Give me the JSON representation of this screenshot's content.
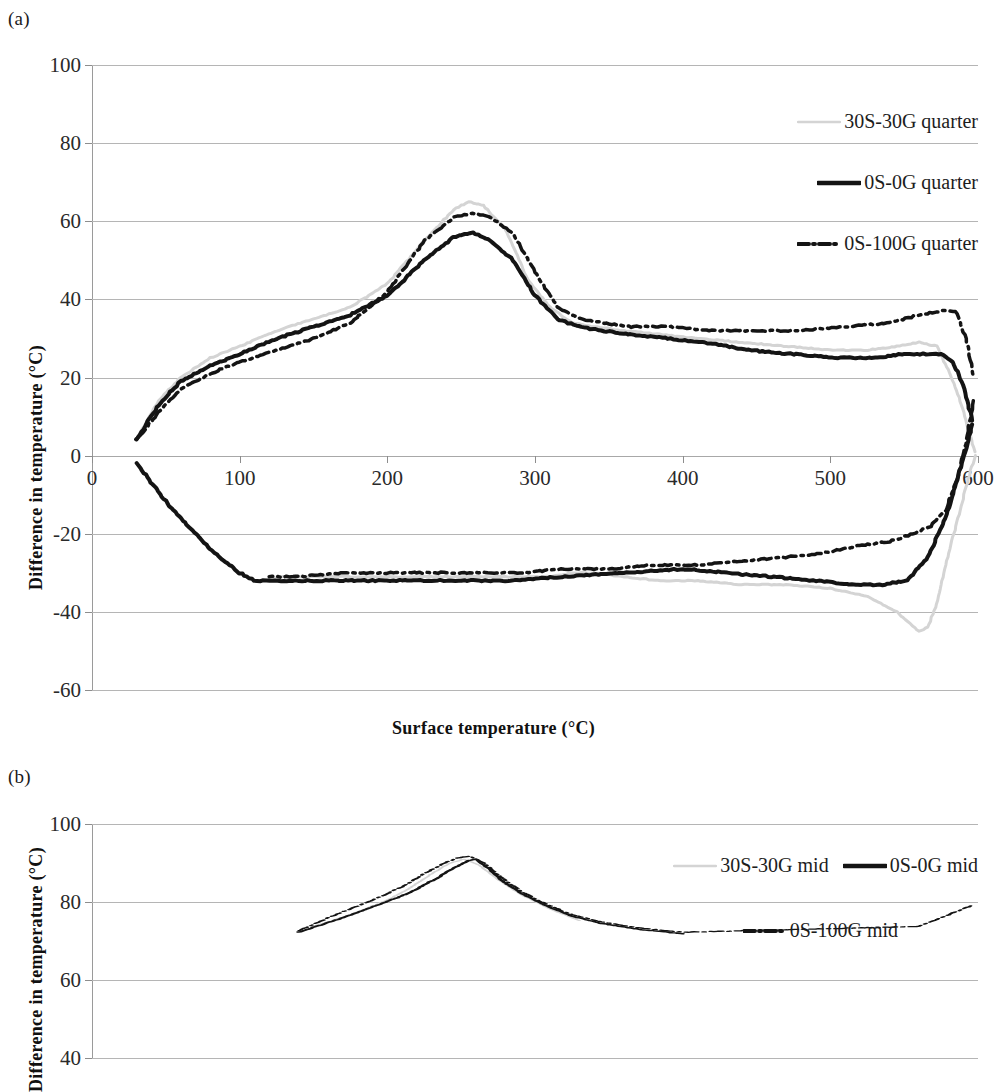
{
  "panels": [
    {
      "id": "a",
      "label": "(a)"
    },
    {
      "id": "b",
      "label": "(b)"
    }
  ],
  "chart_data": [
    {
      "panel": "a",
      "type": "line",
      "title": "",
      "xlabel": "Surface temperature  (°C)",
      "ylabel": "Difference in temperature (°C)",
      "xlim": [
        0,
        600
      ],
      "ylim": [
        -60,
        100
      ],
      "xticks": [
        0,
        100,
        200,
        300,
        400,
        500,
        600
      ],
      "yticks": [
        -60,
        -40,
        -20,
        0,
        20,
        40,
        60,
        80,
        100
      ],
      "grid": true,
      "legend_position": "top-right",
      "series": [
        {
          "name": "30S-30G quarter",
          "style": "solid",
          "color": "#d4d4d4",
          "width": 3,
          "branch_up": {
            "x": [
              30,
              45,
              60,
              80,
              100,
              125,
              150,
              175,
              200,
              225,
              245,
              255,
              265,
              280,
              295,
              310,
              325,
              340,
              360,
              385,
              410,
              440,
              470,
              500,
              525,
              545,
              560,
              572,
              580,
              588,
              594,
              598
            ],
            "y": [
              4,
              14,
              20,
              25,
              28,
              32,
              35,
              38,
              44,
              55,
              63,
              65,
              64,
              58,
              45,
              38,
              34,
              33,
              32,
              31,
              30,
              29,
              28,
              27,
              27,
              28,
              29,
              28,
              22,
              14,
              6,
              1
            ]
          },
          "branch_down": {
            "x": [
              598,
              592,
              585,
              578,
              572,
              566,
              560,
              545,
              525,
              500,
              470,
              440,
              410,
              385,
              360,
              340,
              325,
              310,
              295,
              280,
              265,
              250,
              225,
              200,
              175,
              150,
              130,
              115
            ],
            "y": [
              0,
              -8,
              -18,
              -28,
              -38,
              -44,
              -45,
              -40,
              -36,
              -34,
              -33,
              -33,
              -32,
              -32,
              -31,
              -30,
              -30,
              -31,
              -31,
              -31,
              -31,
              -31,
              -31,
              -31,
              -31,
              -31,
              -31,
              -32
            ]
          }
        },
        {
          "name": "0S-0G quarter",
          "style": "solid",
          "color": "#141414",
          "width": 4,
          "branch_up": {
            "x": [
              30,
              45,
              60,
              80,
              100,
              125,
              150,
              175,
              200,
              225,
              245,
              258,
              270,
              285,
              300,
              315,
              330,
              345,
              365,
              390,
              415,
              445,
              475,
              505,
              530,
              550,
              565,
              575,
              583,
              590,
              596
            ],
            "y": [
              4,
              13,
              19,
              23,
              26,
              30,
              33,
              36,
              41,
              50,
              56,
              57,
              55,
              50,
              41,
              35,
              33,
              32,
              31,
              30,
              29,
              27,
              26,
              25,
              25,
              26,
              26,
              26,
              24,
              18,
              9
            ]
          },
          "branch_down": {
            "x": [
              30,
              55,
              80,
              100,
              110,
              130,
              160,
              200,
              240,
              280,
              320,
              360,
              400,
              430,
              460,
              490,
              515,
              535,
              552,
              566,
              578,
              586,
              592,
              596
            ],
            "y": [
              -2,
              -14,
              -24,
              -30,
              -32,
              -32,
              -32,
              -32,
              -32,
              -32,
              -31,
              -30,
              -29,
              -30,
              -31,
              -32,
              -33,
              -33,
              -32,
              -26,
              -16,
              -6,
              2,
              8
            ]
          }
        },
        {
          "name": "0S-100G quarter",
          "style": "dashdot",
          "color": "#141414",
          "width": 3.5,
          "branch_up": {
            "x": [
              30,
              45,
              60,
              80,
              100,
              125,
              150,
              175,
              200,
              225,
              245,
              258,
              270,
              285,
              300,
              315,
              330,
              345,
              365,
              390,
              420,
              450,
              480,
              510,
              540,
              560,
              575,
              585,
              592,
              597
            ],
            "y": [
              4,
              11,
              17,
              21,
              24,
              27,
              30,
              34,
              42,
              55,
              61,
              62,
              61,
              57,
              47,
              38,
              35,
              34,
              33,
              33,
              32,
              32,
              32,
              33,
              34,
              36,
              37,
              37,
              30,
              20
            ]
          },
          "branch_down": {
            "x": [
              597,
              592,
              586,
              578,
              568,
              556,
              540,
              520,
              495,
              470,
              440,
              410,
              380,
              350,
              320,
              290,
              260,
              230,
              200,
              170,
              140,
              120
            ],
            "y": [
              14,
              4,
              -6,
              -14,
              -18,
              -20,
              -22,
              -23,
              -25,
              -26,
              -27,
              -28,
              -28,
              -29,
              -29,
              -30,
              -30,
              -30,
              -30,
              -30,
              -31,
              -31
            ]
          }
        }
      ]
    },
    {
      "panel": "b",
      "type": "line",
      "title": "",
      "xlabel": "Surface temperature  (°C)",
      "ylabel": "Difference in temperature (°C)",
      "xlim": [
        0,
        600
      ],
      "ylim": [
        -60,
        100
      ],
      "yticks": [
        100,
        80,
        60,
        40
      ],
      "grid": true,
      "legend_position": "top-right",
      "note": "panel is cropped at the bottom edge of the screenshot",
      "series": [
        {
          "name": "30S-30G mid",
          "style": "solid",
          "color": "#d4d4d4",
          "width": 3,
          "branch_up": {
            "x": [
              150,
              175,
              200,
              215,
              230,
              242,
              252,
              262,
              275,
              290,
              310,
              330
            ],
            "y": [
              30,
              38,
              48,
              56,
              66,
              73,
              76,
              72,
              62,
              52,
              42,
              34
            ]
          }
        },
        {
          "name": "0S-0G mid",
          "style": "solid",
          "color": "#141414",
          "width": 4,
          "branch_up": {
            "x": [
              140,
              170,
              195,
              215,
              232,
              245,
              255,
              260,
              268,
              278,
              292,
              308,
              325,
              345,
              370,
              400
            ],
            "y": [
              26,
              36,
              45,
              53,
              62,
              70,
              75,
              76,
              70,
              61,
              52,
              44,
              37,
              32,
              28,
              25
            ]
          }
        },
        {
          "name": "0S-100G mid",
          "style": "dashdot",
          "color": "#141414",
          "width": 3.5,
          "branch_up": {
            "x": [
              140,
              165,
              190,
              210,
              225,
              238,
              248,
              256,
              266,
              278,
              292,
              308,
              325,
              345,
              370,
              400,
              560,
              580,
              595
            ],
            "y": [
              27,
              38,
              48,
              57,
              66,
              73,
              77,
              78,
              73,
              63,
              53,
              45,
              38,
              33,
              29,
              26,
              30,
              38,
              44
            ]
          }
        }
      ]
    }
  ],
  "legend_a": {
    "entries": [
      {
        "label": "30S-30G quarter",
        "style": "solid-gray"
      },
      {
        "label": "0S-0G quarter",
        "style": "solid-black"
      },
      {
        "label": "0S-100G quarter",
        "style": "dashdot-black"
      }
    ]
  },
  "legend_b": {
    "entries": [
      {
        "label": "30S-30G mid",
        "style": "solid-gray"
      },
      {
        "label": "0S-0G mid",
        "style": "solid-black"
      },
      {
        "label": "0S-100G mid",
        "style": "dashdot-black"
      }
    ]
  },
  "colors": {
    "gray_series": "#d4d4d4",
    "black_series": "#141414",
    "gridline": "#b5b5b5",
    "axis": "#9a9a9a",
    "text": "#1a1a1a"
  }
}
